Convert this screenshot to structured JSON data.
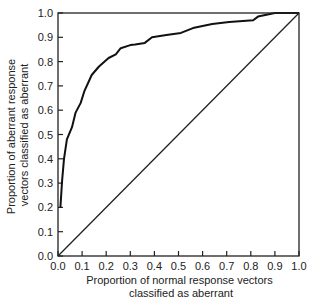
{
  "chart_data": {
    "type": "line",
    "title": "",
    "xlabel": "Proportion of normal response vectors classified as aberrant",
    "xlabel_lines": [
      "Proportion of normal response vectors",
      "classified as aberrant"
    ],
    "ylabel": "Proportion of aberrant response vectors classified as aberrant",
    "ylabel_lines": [
      "Proportion of aberrant response",
      "vectors classified as aberrant"
    ],
    "xlim": [
      0.0,
      1.0
    ],
    "ylim": [
      0.0,
      1.0
    ],
    "xticks": [
      "0.0",
      "0.1",
      "0.2",
      "0.3",
      "0.4",
      "0.5",
      "0.6",
      "0.7",
      "0.8",
      "0.9",
      "1.0"
    ],
    "yticks": [
      "0.0",
      "0.1",
      "0.2",
      "0.3",
      "0.4",
      "0.5",
      "0.6",
      "0.7",
      "0.8",
      "0.9",
      "1.0"
    ],
    "grid": false,
    "legend": null,
    "series": [
      {
        "name": "ROC curve",
        "x": [
          0.01,
          0.017,
          0.025,
          0.037,
          0.058,
          0.073,
          0.094,
          0.11,
          0.14,
          0.17,
          0.21,
          0.24,
          0.26,
          0.3,
          0.32,
          0.36,
          0.39,
          0.45,
          0.51,
          0.56,
          0.64,
          0.71,
          0.81,
          0.83,
          0.9,
          1.0
        ],
        "y": [
          0.2,
          0.31,
          0.4,
          0.48,
          0.53,
          0.59,
          0.63,
          0.68,
          0.745,
          0.78,
          0.815,
          0.83,
          0.855,
          0.868,
          0.87,
          0.877,
          0.9,
          0.91,
          0.918,
          0.938,
          0.955,
          0.963,
          0.97,
          0.985,
          1.0,
          1.0
        ]
      },
      {
        "name": "Chance diagonal",
        "x": [
          0.0,
          1.0
        ],
        "y": [
          0.0,
          1.0
        ]
      }
    ]
  }
}
